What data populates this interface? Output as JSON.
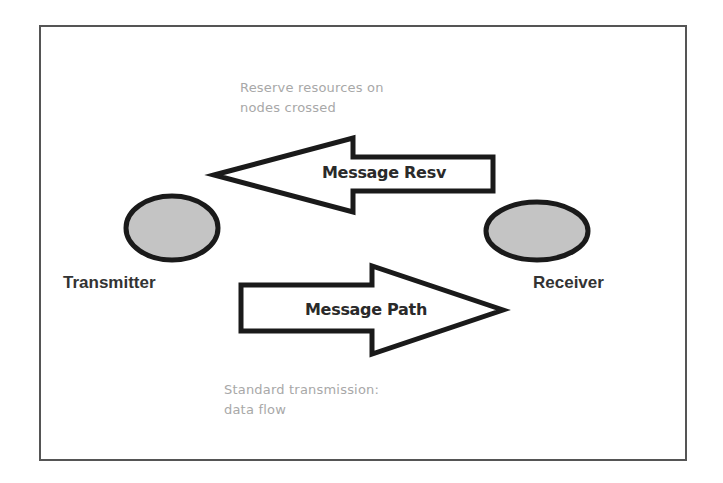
{
  "diagram": {
    "nodes": [
      {
        "id": "transmitter",
        "label": "Transmitter",
        "fill": "#c4c4c4"
      },
      {
        "id": "receiver",
        "label": "Receiver",
        "fill": "#c4c4c4"
      }
    ],
    "edges": [
      {
        "id": "message-resv",
        "from": "receiver",
        "to": "transmitter",
        "label": "Message Resv",
        "note": [
          "Reserve resources on",
          "nodes crossed"
        ]
      },
      {
        "id": "message-path",
        "from": "transmitter",
        "to": "receiver",
        "label": "Message Path",
        "note": [
          "Standard transmission:",
          "data flow"
        ]
      }
    ]
  },
  "colors": {
    "stroke": "#1a1a1a",
    "node_fill": "#c4c4c4",
    "note_text": "#a8a8a8",
    "frame": "#555555"
  }
}
